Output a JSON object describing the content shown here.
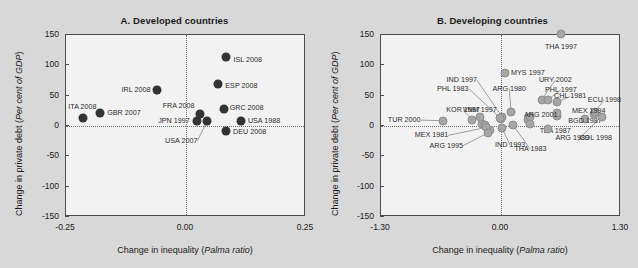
{
  "figure": {
    "background": "#d8d8d8",
    "panel_bg": "#f2f2f2",
    "marker_color_a": "#333333",
    "marker_color_b": "#a6a6a6"
  },
  "chart_data": [
    {
      "type": "scatter",
      "title": "A. Developed countries",
      "xlabel": "Change in inequality (Palma ratio)",
      "xlabel_plain": "Change in inequality (",
      "xlabel_italic": "Palma ratio",
      "xlabel_tail": ")",
      "ylabel_plain": "Change in private debt (",
      "ylabel_italic": "Per cent of GDP",
      "ylabel_tail": ")",
      "xlim": [
        -0.25,
        0.25
      ],
      "ylim": [
        -150,
        150
      ],
      "xticks": [
        -0.25,
        0.0,
        0.25
      ],
      "xticklabels": [
        "-0.25",
        "0.00",
        "0.25"
      ],
      "yticks": [
        -150,
        -100,
        -50,
        0,
        50,
        100,
        150
      ],
      "yticklabels": [
        "-150",
        "-100",
        "-50",
        "0",
        "50",
        "100",
        "150"
      ],
      "grid": false,
      "zero_lines": true,
      "legend": "none",
      "points": [
        {
          "label": "ITA 2008",
          "x": -0.212,
          "y": 11,
          "lx": -0.243,
          "ly": 30,
          "align": "l",
          "leader": false
        },
        {
          "label": "GBR 2007",
          "x": -0.178,
          "y": 19,
          "lx": -0.162,
          "ly": 19,
          "align": "l",
          "leader": false
        },
        {
          "label": "IRL 2008",
          "x": -0.058,
          "y": 58,
          "lx": -0.072,
          "ly": 58,
          "align": "r",
          "leader": false
        },
        {
          "label": "ISL 2008",
          "x": 0.086,
          "y": 112,
          "lx": 0.101,
          "ly": 107,
          "align": "l",
          "leader": false
        },
        {
          "label": "ESP 2008",
          "x": 0.069,
          "y": 67,
          "lx": 0.084,
          "ly": 64,
          "align": "l",
          "leader": false
        },
        {
          "label": "GRC 2008",
          "x": 0.082,
          "y": 27,
          "lx": 0.093,
          "ly": 28,
          "align": "l",
          "leader": false
        },
        {
          "label": "FRA 2008",
          "x": 0.031,
          "y": 18,
          "lx": 0.02,
          "ly": 31,
          "align": "r",
          "leader": false
        },
        {
          "label": "JPN 1997",
          "x": 0.026,
          "y": 7,
          "lx": 0.01,
          "ly": 6,
          "align": "r",
          "leader": false
        },
        {
          "label": "USA 2007",
          "x": 0.046,
          "y": 7,
          "lx": 0.026,
          "ly": -26,
          "align": "r",
          "leader": true
        },
        {
          "label": "USA 1988",
          "x": 0.117,
          "y": 6,
          "lx": 0.131,
          "ly": 6,
          "align": "l",
          "leader": false
        },
        {
          "label": "DEU 2008",
          "x": 0.086,
          "y": -10,
          "lx": 0.1,
          "ly": -12,
          "align": "l",
          "leader": false
        }
      ]
    },
    {
      "type": "scatter",
      "title": "B. Developing countries",
      "xlabel": "Change in inequality (Palma ratio)",
      "xlabel_plain": "Change in inequality (",
      "xlabel_italic": "Palma ratio",
      "xlabel_tail": ")",
      "ylabel_plain": "Change in private debt (",
      "ylabel_italic": "Per cent of GDP",
      "ylabel_tail": ")",
      "xlim": [
        -1.3,
        1.3
      ],
      "ylim": [
        -150,
        150
      ],
      "xticks": [
        -1.3,
        0.0,
        1.3
      ],
      "xticklabels": [
        "-1.30",
        "0.00",
        "1.30"
      ],
      "yticks": [
        -150,
        -100,
        -50,
        0,
        50,
        100,
        150
      ],
      "yticklabels": [
        "-150",
        "-100",
        "-50",
        "0",
        "50",
        "100",
        "150"
      ],
      "grid": false,
      "zero_lines": true,
      "legend": "none",
      "points": [
        {
          "label": "THA 1997",
          "x": 0.66,
          "y": 150,
          "lx": 0.66,
          "ly": 128,
          "align": "c",
          "leader": false
        },
        {
          "label": "MYS 1997",
          "x": 0.05,
          "y": 85,
          "lx": 0.12,
          "ly": 85,
          "align": "l",
          "leader": false
        },
        {
          "label": "IND 1997",
          "x": 0.02,
          "y": 14,
          "lx": -0.25,
          "ly": 74,
          "align": "r",
          "leader": true
        },
        {
          "label": "PHL 1983",
          "x": 0.0,
          "y": 12,
          "lx": -0.34,
          "ly": 60,
          "align": "r",
          "leader": true
        },
        {
          "label": "ARG 1980",
          "x": 0.12,
          "y": 22,
          "lx": 0.1,
          "ly": 60,
          "align": "c",
          "leader": true
        },
        {
          "label": "URY 2002",
          "x": 0.45,
          "y": 42,
          "lx": 0.6,
          "ly": 74,
          "align": "c",
          "leader": true
        },
        {
          "label": "PHL 1997",
          "x": 0.52,
          "y": 42,
          "lx": 0.66,
          "ly": 58,
          "align": "c",
          "leader": true
        },
        {
          "label": "CHL 1981",
          "x": 0.62,
          "y": 38,
          "lx": 0.76,
          "ly": 47,
          "align": "c",
          "leader": true
        },
        {
          "label": "ECU 1998",
          "x": 1.03,
          "y": 22,
          "lx": 1.13,
          "ly": 42,
          "align": "c",
          "leader": true
        },
        {
          "label": "MEX 1994",
          "x": 0.62,
          "y": 20,
          "lx": 0.78,
          "ly": 23,
          "align": "l",
          "leader": false
        },
        {
          "label": "ARG 2001",
          "x": 0.33,
          "y": 13,
          "lx": 0.26,
          "ly": 17,
          "align": "l",
          "leader": false
        },
        {
          "label": "BGD 1987",
          "x": 0.92,
          "y": 10,
          "lx": 0.74,
          "ly": 7,
          "align": "l",
          "leader": false
        },
        {
          "label": "COL 1998",
          "x": 1.1,
          "y": 14,
          "lx": 0.86,
          "ly": -22,
          "align": "l",
          "leader": true
        },
        {
          "label": "KOR 1997",
          "x": -0.3,
          "y": 9,
          "lx": -0.4,
          "ly": 24,
          "align": "c",
          "leader": true
        },
        {
          "label": "TUR 2000",
          "x": -0.62,
          "y": 7,
          "lx": -0.86,
          "ly": 8,
          "align": "r",
          "leader": true
        },
        {
          "label": "VNM 1997",
          "x": -0.22,
          "y": 14,
          "lx": -0.22,
          "ly": 24,
          "align": "c",
          "leader": false
        },
        {
          "label": "MEX 1981",
          "x": -0.15,
          "y": -4,
          "lx": -0.56,
          "ly": -17,
          "align": "r",
          "leader": true
        },
        {
          "label": "ARG 1995",
          "x": -0.13,
          "y": -13,
          "lx": -0.4,
          "ly": -34,
          "align": "r",
          "leader": true
        },
        {
          "label": "IND 1993",
          "x": 0.02,
          "y": -5,
          "lx": 0.11,
          "ly": -33,
          "align": "c",
          "leader": true
        },
        {
          "label": "THA 1983",
          "x": 0.14,
          "y": 0,
          "lx": 0.33,
          "ly": -40,
          "align": "c",
          "leader": true
        },
        {
          "label": "TZA 1987",
          "x": 0.33,
          "y": 1,
          "lx": 0.43,
          "ly": -10,
          "align": "l",
          "leader": false
        },
        {
          "label": "ARG 1989",
          "x": 0.52,
          "y": -6,
          "lx": 0.6,
          "ly": -22,
          "align": "l",
          "leader": false
        }
      ],
      "extra_points": [
        {
          "x": -0.19,
          "y": 2
        },
        {
          "x": -0.16,
          "y": 0
        },
        {
          "x": -0.11,
          "y": -8
        },
        {
          "x": 0.01,
          "y": 10
        },
        {
          "x": 0.3,
          "y": 9
        },
        {
          "x": 0.62,
          "y": 15
        },
        {
          "x": 1.02,
          "y": 18
        }
      ]
    }
  ]
}
